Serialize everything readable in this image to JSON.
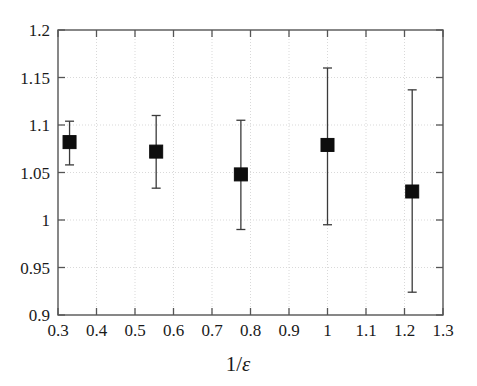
{
  "chart_data": {
    "type": "scatter",
    "title": "",
    "subtitle": "",
    "xlabel": "1/ε",
    "ylabel": "",
    "xlim": [
      0.3,
      1.3
    ],
    "ylim": [
      0.9,
      1.2
    ],
    "grid": true,
    "legend": false,
    "legend_position": "none",
    "xticks": [
      0.3,
      0.4,
      0.5,
      0.6,
      0.7,
      0.8,
      0.9,
      1.0,
      1.1,
      1.2,
      1.3
    ],
    "xtick_labels": [
      "0.3",
      "0.4",
      "0.5",
      "0.6",
      "0.7",
      "0.8",
      "0.9",
      "1",
      "1.1",
      "1.2",
      "1.3"
    ],
    "yticks": [
      0.9,
      0.95,
      1.0,
      1.05,
      1.1,
      1.15,
      1.2
    ],
    "ytick_labels": [
      "0.9",
      "0.95",
      "1",
      "1.05",
      "1.1",
      "1.15",
      "1.2"
    ],
    "marker": "filled-square",
    "marker_color": "#0d0d0d",
    "errorbar_color": "#3a3a3a",
    "series": [
      {
        "name": "measurement",
        "x": [
          0.33,
          0.555,
          0.775,
          1.0,
          1.22
        ],
        "y": [
          1.082,
          1.072,
          1.048,
          1.079,
          1.03
        ],
        "yerr_low": [
          0.024,
          0.0385,
          0.058,
          0.084,
          0.106
        ],
        "yerr_high": [
          0.022,
          0.038,
          0.057,
          0.081,
          0.107
        ],
        "y_low": [
          1.058,
          1.0335,
          0.99,
          0.995,
          0.924
        ],
        "y_high": [
          1.104,
          1.11,
          1.105,
          1.16,
          1.137
        ]
      }
    ]
  },
  "axes": {
    "x_title": "1/ε",
    "x_title_numerator": "1/",
    "x_title_symbol": "ε"
  }
}
